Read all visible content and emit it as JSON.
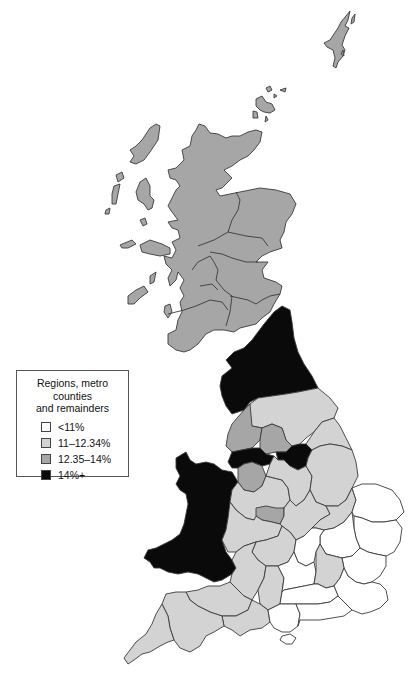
{
  "legend": {
    "title_line1": "Regions, metro counties",
    "title_line2": "and remainders",
    "items": [
      {
        "label": "<11%",
        "color": "#ffffff"
      },
      {
        "label": "11–12.34%",
        "color": "#d3d3d3"
      },
      {
        "label": "12.35–14%",
        "color": "#a6a6a6"
      },
      {
        "label": "14%+",
        "color": "#0a0a0a"
      }
    ]
  },
  "map": {
    "subject": "Great Britain choropleth by regions, metro counties and remainders",
    "colors": {
      "lt11": "#ffffff",
      "c11_12": "#d3d3d3",
      "c12_14": "#a6a6a6",
      "c14plus": "#0a0a0a",
      "outline": "#3a3a3a"
    },
    "regions": [
      {
        "name": "Scotland",
        "category": "12.35–14%"
      },
      {
        "name": "Northern England (North)",
        "category": "14%+"
      },
      {
        "name": "Wales",
        "category": "14%+"
      },
      {
        "name": "South Yorkshire",
        "category": "14%+"
      },
      {
        "name": "Merseyside / Greater Manchester",
        "category": "14%+"
      },
      {
        "name": "West Yorkshire",
        "category": "12.35–14%"
      },
      {
        "name": "Lancashire / Cheshire remainder",
        "category": "12.35–14%"
      },
      {
        "name": "West Midlands metro",
        "category": "12.35–14%"
      },
      {
        "name": "Yorkshire & Humberside remainder",
        "category": "11–12.34%"
      },
      {
        "name": "East Midlands",
        "category": "11–12.34%"
      },
      {
        "name": "West Midlands remainder",
        "category": "11–12.34%"
      },
      {
        "name": "South West",
        "category": "11–12.34%"
      },
      {
        "name": "Greater London",
        "category": "11–12.34%"
      },
      {
        "name": "East Anglia",
        "category": "<11%"
      },
      {
        "name": "South East remainder",
        "category": "<11%"
      }
    ]
  }
}
